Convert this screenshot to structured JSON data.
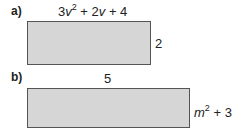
{
  "figures": [
    {
      "label": "a)",
      "width_expr": {
        "coef1": "3",
        "var1": "v",
        "exp1": "2",
        "rest": " + 2",
        "var2": "v",
        "tail": " + 4"
      },
      "height_expr": "2"
    },
    {
      "label": "b)",
      "width_expr": "5",
      "height_expr": {
        "var": "m",
        "exp": "2",
        "tail": " + 3"
      }
    }
  ],
  "colors": {
    "fill": "#d6d6d6",
    "border": "#555555"
  }
}
